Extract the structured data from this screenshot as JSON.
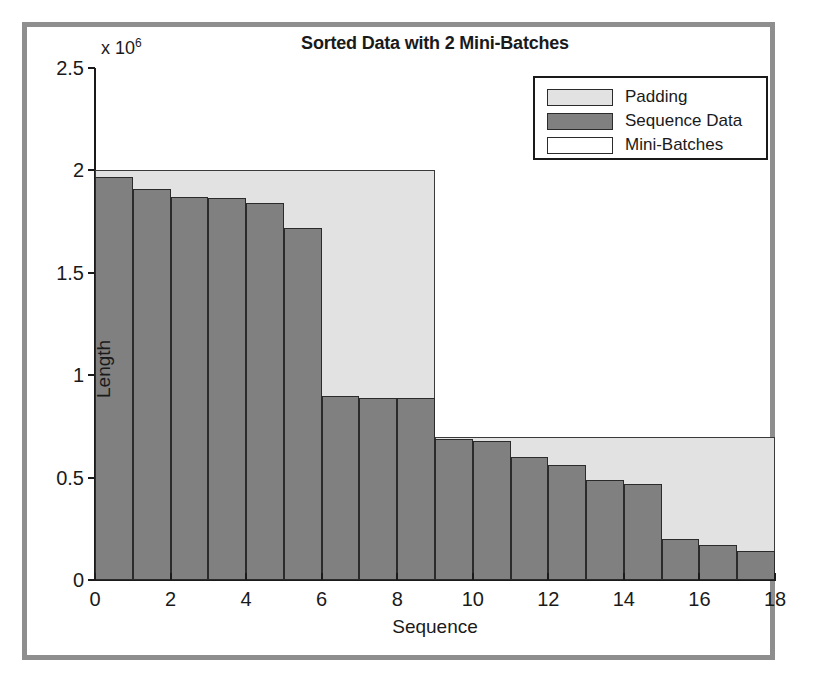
{
  "chart_data": {
    "type": "bar",
    "title": "Sorted Data with 2 Mini-Batches",
    "xlabel": "Sequence",
    "ylabel": "Length",
    "y_exponent_label": "x 10",
    "y_exponent_power": "6",
    "y_scale_factor": 1000000,
    "xlim": [
      0,
      18
    ],
    "ylim": [
      0,
      2500000
    ],
    "xticks": [
      "0",
      "2",
      "4",
      "6",
      "8",
      "10",
      "12",
      "14",
      "16",
      "18"
    ],
    "xtick_values": [
      0,
      2,
      4,
      6,
      8,
      10,
      12,
      14,
      16,
      18
    ],
    "yticks": [
      "0",
      "0.5",
      "1",
      "1.5",
      "2",
      "2.5"
    ],
    "ytick_values": [
      0,
      500000,
      1000000,
      1500000,
      2000000,
      2500000
    ],
    "grid": false,
    "legend_position": "upper right",
    "legend": [
      {
        "label": "Padding",
        "color": "#e2e2e2"
      },
      {
        "label": "Sequence Data",
        "color": "#808080"
      },
      {
        "label": "Mini-Batches",
        "color": "#ffffff"
      }
    ],
    "categories": [
      1,
      2,
      3,
      4,
      5,
      6,
      7,
      8,
      9,
      10,
      11,
      12,
      13,
      14,
      15,
      16,
      17,
      18
    ],
    "values": [
      1970000,
      1910000,
      1870000,
      1865000,
      1840000,
      1720000,
      900000,
      890000,
      888000,
      690000,
      680000,
      600000,
      560000,
      490000,
      470000,
      200000,
      170000,
      140000
    ],
    "mini_batches": [
      {
        "name": "Mini-Batch 1",
        "x_start": 0,
        "x_end": 9,
        "padded_length": 2000000
      },
      {
        "name": "Mini-Batch 2",
        "x_start": 9,
        "x_end": 18,
        "padded_length": 700000
      }
    ]
  },
  "colors": {
    "padding": "#e2e2e2",
    "sequence_data": "#808080",
    "mini_batch": "#ffffff",
    "axis": "#1a1a1a",
    "frame": "#8e8e8e"
  }
}
